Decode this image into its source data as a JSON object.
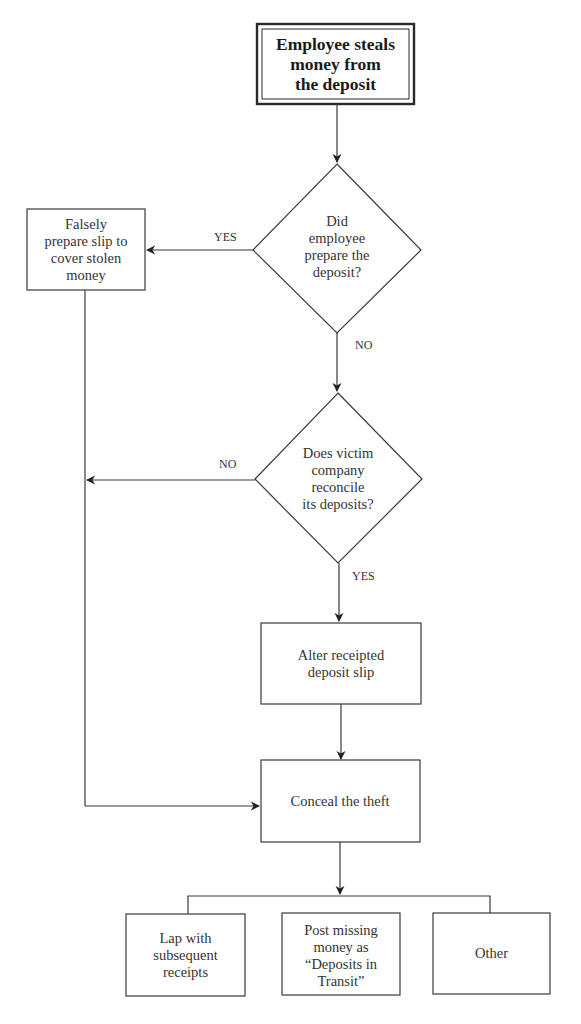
{
  "diagram": {
    "start": {
      "lines": [
        "Employee steals",
        "money from",
        "the deposit"
      ]
    },
    "decision1": {
      "lines": [
        "Did",
        "employee",
        "prepare the",
        "deposit?"
      ]
    },
    "falsely_prepare": {
      "lines": [
        "Falsely",
        "prepare slip to",
        "cover stolen",
        "money"
      ]
    },
    "decision2": {
      "lines": [
        "Does victim",
        "company",
        "reconcile",
        "its deposits?"
      ]
    },
    "alter": {
      "lines": [
        "Alter receipted",
        "deposit slip"
      ]
    },
    "conceal": {
      "lines": [
        "Conceal the theft"
      ]
    },
    "outcomes": [
      {
        "lines": [
          "Lap with",
          "subsequent",
          "receipts"
        ]
      },
      {
        "lines": [
          "Post missing",
          "money as",
          "“Deposits in",
          "Transit”"
        ]
      },
      {
        "lines": [
          "Other"
        ]
      }
    ],
    "edge_labels": {
      "d1_yes": "YES",
      "d1_no": "NO",
      "d2_no": "NO",
      "d2_yes": "YES"
    }
  }
}
